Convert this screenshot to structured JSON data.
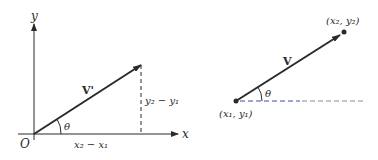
{
  "left_diagram": {
    "y_axis_label": "y",
    "x_axis_label": "x",
    "origin_label": "O",
    "vector_label": "V'",
    "angle_label": "θ",
    "horizontal_component_label": "x₂ − x₁",
    "vertical_component_label": "y₂ − y₁"
  },
  "right_diagram": {
    "vector_label": "V",
    "angle_label": "θ",
    "start_point_label": "(x₁, y₁)",
    "end_point_label": "(x₂, y₂)"
  },
  "colors": {
    "ink": "#2a2a2a",
    "dashed_blue": "#3b4fa8",
    "dashed_gray": "#8a8a8a"
  }
}
